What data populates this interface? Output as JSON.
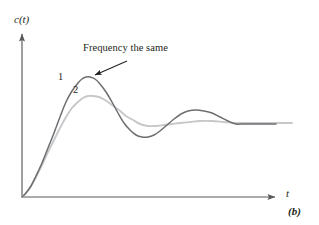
{
  "figure": {
    "caption": "(b)",
    "axis": {
      "y_label": "c(t)",
      "x_label": "t"
    },
    "annotation": {
      "text": "Frequency the same"
    },
    "curve_labels": {
      "curve1": "1",
      "curve2": "2"
    },
    "colors": {
      "axis": "#58595b",
      "curve1": "#6d6e71",
      "curve2": "#c7c8ca",
      "text": "#231f20",
      "background": "#ffffff"
    }
  },
  "chart_data": {
    "type": "line",
    "title": "",
    "subtitle": "",
    "xlabel": "t",
    "ylabel": "c(t)",
    "grid": false,
    "legend": "none",
    "axes": {
      "origin_px": [
        22,
        197
      ],
      "x_axis_end_px": [
        281,
        197
      ],
      "y_axis_top_px": [
        22,
        28
      ],
      "xlim": [
        0,
        1
      ],
      "ylim": [
        0,
        1
      ]
    },
    "annotations": [
      {
        "text": "Frequency the same",
        "text_px": [
          83,
          43
        ],
        "arrow_from_px": [
          127,
          61
        ],
        "arrow_to_px": [
          91,
          77
        ]
      },
      {
        "text": "1",
        "px": [
          58,
          72
        ]
      },
      {
        "text": "2",
        "px": [
          73,
          85
        ]
      }
    ],
    "series": [
      {
        "name": "1",
        "label": "1",
        "color": "#6d6e71",
        "description": "Underdamped step response with larger overshoot, same oscillation frequency",
        "steady_state_px_y": 123,
        "peak1_px": [
          86,
          77
        ],
        "trough_px": [
          145,
          137
        ],
        "peak2_px": [
          196,
          110
        ],
        "end_px": [
          276,
          124
        ],
        "points_px": [
          [
            22,
            197
          ],
          [
            26,
            193
          ],
          [
            31,
            186
          ],
          [
            36,
            176
          ],
          [
            42,
            163
          ],
          [
            48,
            148
          ],
          [
            54,
            133
          ],
          [
            60,
            117
          ],
          [
            66,
            102
          ],
          [
            72,
            91
          ],
          [
            78,
            83
          ],
          [
            82,
            79
          ],
          [
            86,
            77
          ],
          [
            90,
            77
          ],
          [
            95,
            79
          ],
          [
            100,
            84
          ],
          [
            106,
            92
          ],
          [
            112,
            102
          ],
          [
            118,
            113
          ],
          [
            124,
            123
          ],
          [
            130,
            130
          ],
          [
            136,
            135
          ],
          [
            142,
            137
          ],
          [
            148,
            137
          ],
          [
            154,
            135
          ],
          [
            160,
            131
          ],
          [
            167,
            125
          ],
          [
            174,
            119
          ],
          [
            181,
            114
          ],
          [
            188,
            111
          ],
          [
            196,
            110
          ],
          [
            204,
            111
          ],
          [
            212,
            113
          ],
          [
            220,
            117
          ],
          [
            228,
            121
          ],
          [
            236,
            124
          ],
          [
            244,
            124
          ],
          [
            252,
            124
          ],
          [
            262,
            124
          ],
          [
            276,
            124
          ]
        ]
      },
      {
        "name": "2",
        "label": "2",
        "color": "#c7c8ca",
        "description": "Underdamped step response with smaller overshoot, same oscillation frequency",
        "steady_state_px_y": 123,
        "peak1_px": [
          88,
          96
        ],
        "trough_px": [
          148,
          126
        ],
        "peak2_px": [
          198,
          121
        ],
        "end_px": [
          292,
          123
        ],
        "points_px": [
          [
            22,
            197
          ],
          [
            26,
            193
          ],
          [
            31,
            186
          ],
          [
            36,
            177
          ],
          [
            42,
            165
          ],
          [
            48,
            152
          ],
          [
            54,
            140
          ],
          [
            60,
            128
          ],
          [
            66,
            117
          ],
          [
            72,
            108
          ],
          [
            78,
            102
          ],
          [
            83,
            98
          ],
          [
            88,
            96
          ],
          [
            93,
            96
          ],
          [
            99,
            97
          ],
          [
            105,
            100
          ],
          [
            112,
            105
          ],
          [
            119,
            110
          ],
          [
            126,
            116
          ],
          [
            133,
            120
          ],
          [
            140,
            124
          ],
          [
            148,
            126
          ],
          [
            156,
            126
          ],
          [
            164,
            125
          ],
          [
            172,
            124
          ],
          [
            180,
            123
          ],
          [
            190,
            122
          ],
          [
            200,
            121
          ],
          [
            212,
            121
          ],
          [
            224,
            122
          ],
          [
            236,
            123
          ],
          [
            250,
            123
          ],
          [
            265,
            123
          ],
          [
            280,
            123
          ],
          [
            292,
            123
          ]
        ]
      }
    ]
  }
}
